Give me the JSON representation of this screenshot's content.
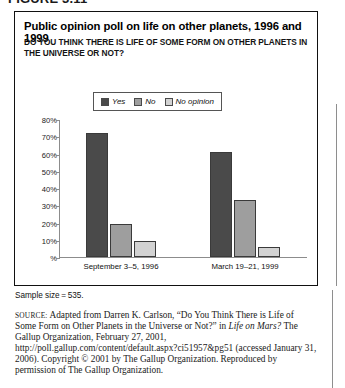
{
  "figure": {
    "label": "FIGURE 3.11"
  },
  "chart": {
    "title": "Public opinion poll on life on other planets, 1996 and 1999",
    "question": "DO YOU THINK THERE IS LIFE OF SOME FORM ON OTHER PLANETS IN THE UNIVERSE OR NOT?",
    "sample_size": "Sample size = 535.",
    "legend": [
      {
        "label": "Yes",
        "color": "#4a4a4a"
      },
      {
        "label": "No",
        "color": "#9e9e9e"
      },
      {
        "label": "No opinion",
        "color": "#d2d2d2"
      }
    ]
  },
  "chart_data": {
    "type": "bar",
    "title": "Public opinion poll on life on other planets, 1996 and 1999",
    "subtitle": "DO YOU THINK THERE IS LIFE OF SOME FORM ON OTHER PLANETS IN THE UNIVERSE OR NOT?",
    "xlabel": "",
    "ylabel": "%",
    "ylim": [
      0,
      80
    ],
    "yticks": [
      0,
      10,
      20,
      30,
      40,
      50,
      60,
      70,
      80
    ],
    "ytick_labels": [
      "%",
      "10%",
      "20%",
      "30%",
      "40%",
      "50%",
      "60%",
      "70%",
      "80%"
    ],
    "grid": false,
    "legend_position": "top-center",
    "categories": [
      "September 3–5, 1996",
      "March 19–21, 1999"
    ],
    "series": [
      {
        "name": "Yes",
        "color": "#4a4a4a",
        "values": [
          72,
          61
        ]
      },
      {
        "name": "No",
        "color": "#9e9e9e",
        "values": [
          19,
          33
        ]
      },
      {
        "name": "No opinion",
        "color": "#d2d2d2",
        "values": [
          9,
          6
        ]
      }
    ]
  },
  "source": {
    "caps": "SOURCE:",
    "line1": " Adapted from Darren K. Carlson, “Do You Think There is Life of Some Form on Other Planets in the Universe or Not?” in ",
    "italic1": "Life on Mars?",
    "line2": " The Gallup Organization, February 27, 2001, http://poll.gallup.com/content/default.aspx?ci51957&pg51 (accessed January 31, 2006). Copyright © 2001 by The Gallup Organization. Reproduced by permission of The Gallup Organization."
  }
}
